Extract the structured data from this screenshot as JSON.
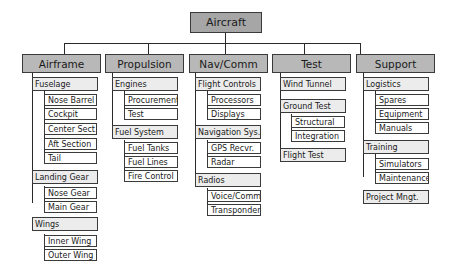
{
  "diagram": {
    "type": "work-breakdown-structure",
    "root": {
      "label": "Aircraft"
    },
    "branches": [
      {
        "label": "Airframe",
        "children": [
          {
            "label": "Fuselage",
            "children": [
              "Nose Barrel",
              "Cockpit",
              "Center Sect.",
              "Aft Section",
              "Tail"
            ]
          },
          {
            "label": "Landing Gear",
            "children": [
              "Nose Gear",
              "Main Gear"
            ]
          },
          {
            "label": "Wings",
            "children": [
              "Inner Wing",
              "Outer Wing"
            ]
          }
        ]
      },
      {
        "label": "Propulsion",
        "children": [
          {
            "label": "Engines",
            "children": [
              "Procurement",
              "Test"
            ]
          },
          {
            "label": "Fuel System",
            "children": [
              "Fuel Tanks",
              "Fuel Lines",
              "Fire Control"
            ]
          }
        ]
      },
      {
        "label": "Nav/Comm",
        "children": [
          {
            "label": "Flight Controls",
            "children": [
              "Processors",
              "Displays"
            ]
          },
          {
            "label": "Navigation Sys.",
            "children": [
              "GPS Recvr.",
              "Radar"
            ]
          },
          {
            "label": "Radios",
            "children": [
              "Voice/Comm.",
              "Transponder"
            ]
          }
        ]
      },
      {
        "label": "Test",
        "children": [
          {
            "label": "Wind Tunnel",
            "children": []
          },
          {
            "label": "Ground Test",
            "children": [
              "Structural",
              "Integration"
            ]
          },
          {
            "label": "Flight Test",
            "children": []
          }
        ]
      },
      {
        "label": "Support",
        "children": [
          {
            "label": "Logistics",
            "children": [
              "Spares",
              "Equipment",
              "Manuals"
            ]
          },
          {
            "label": "Training",
            "children": [
              "Simulators",
              "Maintenance"
            ]
          },
          {
            "label": "Project Mngt.",
            "children": []
          }
        ]
      }
    ]
  },
  "colors": {
    "root_fill": "#a6a6a6",
    "level1_fill": "#b8b8b8",
    "level2_fill": "#ececec",
    "level3_fill": "#ffffff",
    "line": "#2a2a2a"
  }
}
